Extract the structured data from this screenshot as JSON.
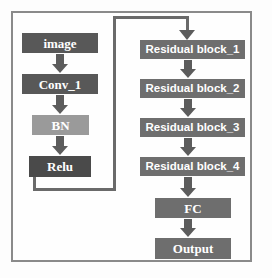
{
  "diagram": {
    "colors": {
      "node_dark": "#585858",
      "node_mid": "#6e6e6e",
      "node_light": "#9a9a9a",
      "node_darker": "#4a4a4a",
      "arrow": "#5c5c5c",
      "skip_line": "#6a6a6a",
      "frame": "#8a8a8a",
      "label_text": "#ffffff",
      "background": "#fefefe"
    },
    "left_branch": {
      "nodes": [
        {
          "id": "image",
          "label": "image"
        },
        {
          "id": "conv_1",
          "label": "Conv_1"
        },
        {
          "id": "bn",
          "label": "BN"
        },
        {
          "id": "relu",
          "label": "Relu"
        }
      ]
    },
    "right_branch": {
      "nodes": [
        {
          "id": "residual_block_1",
          "label": "Residual block_1"
        },
        {
          "id": "residual_block_2",
          "label": "Residual block_2"
        },
        {
          "id": "residual_block_3",
          "label": "Residual block_3"
        },
        {
          "id": "residual_block_4",
          "label": "Residual block_4"
        },
        {
          "id": "fc",
          "label": "FC"
        },
        {
          "id": "output",
          "label": "Output"
        }
      ]
    },
    "connections": {
      "image_to_conv1": "arrow-down",
      "conv1_to_bn": "arrow-down",
      "bn_to_relu": "arrow-down",
      "relu_to_residual_block_1": "skip-connection",
      "rb1_to_rb2": "arrow-down",
      "rb2_to_rb3": "arrow-down",
      "rb3_to_rb4": "arrow-down",
      "rb4_to_fc": "arrow-down",
      "fc_to_output": "arrow-down"
    }
  }
}
